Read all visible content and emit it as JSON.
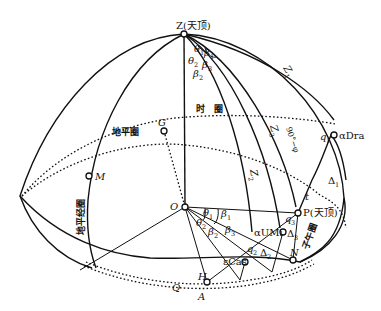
{
  "diagram": {
    "type": "celestial-sphere-construction",
    "points": {
      "Z": "Z(天顶)",
      "P": "P(天顶)",
      "O": "O",
      "G": "G",
      "M": "M",
      "H": "H",
      "N": "N",
      "Q": "Q",
      "A": "A",
      "alphaDra": "αDra",
      "alphaUMi": "αUMi",
      "epsilonCas": "εCas"
    },
    "circle_labels": {
      "hour_circle": "时　圈",
      "horizon_circle": "地平圈",
      "horizon_meridian": "地平经圈",
      "meridian": "子午圈"
    },
    "arc_labels": {
      "z1": "Z",
      "z1_sub": "1",
      "z2": "Z",
      "z2_sub": "2",
      "z3": "Z",
      "z3_sub": "3",
      "colatitude": "90°−φ",
      "q1": "q",
      "q1_sub": "1",
      "q2": "q",
      "q2_sub": "2",
      "q3": "q",
      "q3_sub": "3",
      "delta1": "Δ",
      "delta1_sub": "1",
      "delta2": "Δ",
      "delta2_sub": "2",
      "delta3": "Δ",
      "delta3_sub": "3",
      "t": "t"
    },
    "angle_labels": {
      "theta1": "θ",
      "theta1_sub": "1",
      "theta2": "θ",
      "theta2_sub": "2",
      "theta3": "θ",
      "theta3_sub": "3",
      "beta1": "β",
      "beta1_sub": "1",
      "beta2": "β",
      "beta2_sub": "2",
      "beta3": "β",
      "beta3_sub": "3"
    }
  }
}
